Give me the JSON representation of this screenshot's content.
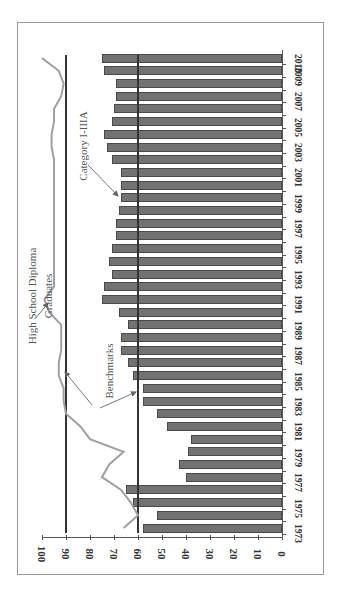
{
  "chart_data": {
    "type": "bar",
    "orientation": "horizontal-rotated (figure rotated 90° clockwise)",
    "title": "",
    "xlabel": "",
    "ylabel": "",
    "ylim": [
      0,
      100
    ],
    "value_ticks": [
      "0",
      "10",
      "20",
      "30",
      "40",
      "50",
      "60",
      "70",
      "80",
      "90",
      "100"
    ],
    "category_tick_labels": [
      "1973",
      "1975",
      "1977",
      "1979",
      "1981",
      "1983",
      "1985",
      "1987",
      "1989",
      "1991",
      "1993",
      "1995",
      "1997",
      "1999",
      "2001",
      "2003",
      "2005",
      "2007",
      "2009",
      "2010"
    ],
    "categories": [
      1973,
      1974,
      1975,
      1976,
      1977,
      1978,
      1979,
      1980,
      1981,
      1982,
      1983,
      1984,
      1985,
      1986,
      1987,
      1988,
      1989,
      1990,
      1991,
      1992,
      1993,
      1994,
      1995,
      1996,
      1997,
      1998,
      1999,
      2000,
      2001,
      2002,
      2003,
      2004,
      2005,
      2006,
      2007,
      2008,
      2009,
      2010
    ],
    "series": [
      {
        "name": "Category I-IIIA",
        "type": "bar",
        "values": [
          58,
          52,
          62,
          65,
          40,
          43,
          39,
          38,
          48,
          52,
          58,
          58,
          62,
          64,
          67,
          67,
          64,
          68,
          75,
          74,
          71,
          72,
          71,
          69,
          69,
          68,
          67,
          67,
          67,
          71,
          73,
          74,
          71,
          70,
          69,
          69,
          74,
          75
        ]
      },
      {
        "name": "High School Diploma Graduates",
        "type": "line",
        "values": [
          66,
          60,
          63,
          67,
          75,
          72,
          66,
          80,
          84,
          90,
          91,
          91,
          93,
          93,
          92,
          92,
          92,
          97,
          99,
          95,
          95,
          95,
          95,
          95,
          95,
          95,
          95,
          95,
          95,
          95,
          96,
          96,
          95,
          95,
          92,
          91,
          93,
          100
        ]
      }
    ],
    "benchmarks": [
      {
        "name": "Benchmark (High School Diploma Graduates)",
        "value": 90
      },
      {
        "name": "Benchmark (Category I-IIIA)",
        "value": 60
      }
    ],
    "annotations": [
      "High School Diploma Graduates",
      "Benchmarks",
      "Category I-IIIA"
    ],
    "grid": false,
    "legend": "none (direct annotations)"
  },
  "labels": {
    "hsdg_line1": "High School Diploma",
    "hsdg_line2": "Graduates",
    "benchmarks": "Benchmarks",
    "category": "Category I-IIIA"
  },
  "colors": {
    "bar_fill": "#727272",
    "bar_edge": "#4a4a4a",
    "benchmark_line": "#333333",
    "hsdg_line": "#a0a0a0",
    "annotation_text": "#555555"
  }
}
